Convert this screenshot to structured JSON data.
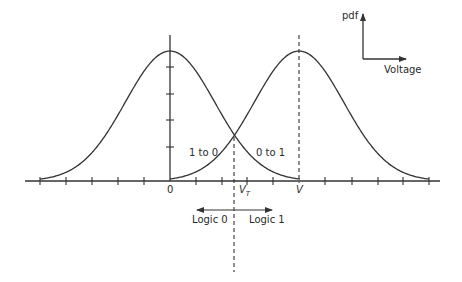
{
  "diagram": {
    "type": "overlapping-pdf-curves",
    "colors": {
      "line": "#333333",
      "background": "#ffffff"
    },
    "legend_axes": {
      "y_label": "pdf",
      "x_label": "Voltage"
    },
    "curves": [
      {
        "name": "logic-0-distribution",
        "center_label": "0"
      },
      {
        "name": "logic-1-distribution",
        "center_label": "V"
      }
    ],
    "threshold": {
      "label_main": "V",
      "label_sub": "T"
    },
    "error_labels": {
      "left": "1 to 0",
      "right": "0 to 1"
    },
    "decision_regions": {
      "left": "Logic 0",
      "right": "Logic 1"
    },
    "axis_ticks": {
      "x_tick_count_each_side": 5,
      "y_tick_count": 4
    }
  }
}
